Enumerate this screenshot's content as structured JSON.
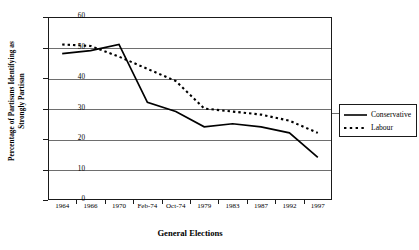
{
  "chart_data": {
    "type": "line",
    "title": "",
    "xlabel": "General Elections",
    "ylabel_line1": "Percentage of Partisans Identifying as",
    "ylabel_line2": "Strongly Partisan",
    "categories": [
      "1964",
      "1966",
      "1970",
      "Feb-74",
      "Oct-74",
      "1979",
      "1983",
      "1987",
      "1992",
      "1997"
    ],
    "ylim": [
      0,
      60
    ],
    "yticks": [
      0,
      10,
      20,
      30,
      40,
      50,
      60
    ],
    "grid": true,
    "legend_position": "right",
    "series": [
      {
        "name": "Conservative",
        "style": "solid",
        "color": "#000000",
        "values": [
          48,
          49,
          51,
          32,
          29,
          24,
          25,
          24,
          22,
          14
        ]
      },
      {
        "name": "Labour",
        "style": "dotted",
        "color": "#000000",
        "values": [
          51,
          50.5,
          47,
          43,
          39,
          30,
          29,
          28,
          26,
          22
        ]
      }
    ]
  },
  "legend": {
    "items": [
      {
        "label": "Conservative",
        "style": "solid"
      },
      {
        "label": "Labour",
        "style": "dotted"
      }
    ]
  }
}
